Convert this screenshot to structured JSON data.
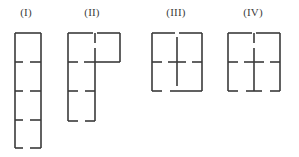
{
  "page": {
    "background_color": "#ffffff",
    "line_color": "#3a3a3a",
    "line_width": 1.6
  },
  "labels": [
    {
      "id": "I",
      "text": "(I)"
    },
    {
      "id": "II",
      "text": "(II)"
    },
    {
      "id": "III",
      "text": "(III)"
    },
    {
      "id": "IV",
      "text": "(IV)"
    }
  ],
  "chart_data": {
    "type": "diagram",
    "figures": [
      {
        "label": "(I)",
        "shape": "tall narrow rectangle with three interior horizontal divider pairs",
        "bounds": {
          "x1": 15,
          "y1": 33,
          "x2": 41,
          "y2": 148
        },
        "segments": [
          {
            "name": "top-edge-left",
            "x1": 15,
            "y1": 33,
            "x2": 28,
            "y2": 33
          },
          {
            "name": "top-edge-right",
            "x1": 28,
            "y1": 33,
            "x2": 41,
            "y2": 33
          },
          {
            "name": "left-edge-upper",
            "x1": 15,
            "y1": 33,
            "x2": 15,
            "y2": 62
          },
          {
            "name": "left-edge-second",
            "x1": 15,
            "y1": 62,
            "x2": 15,
            "y2": 91
          },
          {
            "name": "left-edge-third",
            "x1": 15,
            "y1": 91,
            "x2": 15,
            "y2": 120
          },
          {
            "name": "left-edge-lower",
            "x1": 15,
            "y1": 120,
            "x2": 15,
            "y2": 148
          },
          {
            "name": "right-edge-upper",
            "x1": 41,
            "y1": 33,
            "x2": 41,
            "y2": 62
          },
          {
            "name": "right-edge-second",
            "x1": 41,
            "y1": 62,
            "x2": 41,
            "y2": 91
          },
          {
            "name": "right-edge-third",
            "x1": 41,
            "y1": 91,
            "x2": 41,
            "y2": 120
          },
          {
            "name": "right-edge-lower",
            "x1": 41,
            "y1": 120,
            "x2": 41,
            "y2": 148
          },
          {
            "name": "divider1-left-stub",
            "x1": 15,
            "y1": 62,
            "x2": 23,
            "y2": 62
          },
          {
            "name": "divider1-right-stub",
            "x1": 30,
            "y1": 62,
            "x2": 41,
            "y2": 62
          },
          {
            "name": "divider2-left-stub",
            "x1": 15,
            "y1": 91,
            "x2": 23,
            "y2": 91
          },
          {
            "name": "divider2-right-stub",
            "x1": 30,
            "y1": 91,
            "x2": 41,
            "y2": 91
          },
          {
            "name": "divider3-left-stub",
            "x1": 15,
            "y1": 120,
            "x2": 23,
            "y2": 120
          },
          {
            "name": "divider3-right-stub",
            "x1": 30,
            "y1": 120,
            "x2": 41,
            "y2": 120
          },
          {
            "name": "bottom-edge-left",
            "x1": 15,
            "y1": 148,
            "x2": 23,
            "y2": 148
          },
          {
            "name": "bottom-edge-right",
            "x1": 30,
            "y1": 148,
            "x2": 41,
            "y2": 148
          }
        ]
      },
      {
        "label": "(II)",
        "shape": "P / L shaped outline: wide upper box over a narrow lower column",
        "bounds": {
          "x1": 68,
          "y1": 33,
          "x2": 120,
          "y2": 121
        },
        "segments": [
          {
            "name": "top-edge-left",
            "x1": 68,
            "y1": 33,
            "x2": 93,
            "y2": 33
          },
          {
            "name": "top-edge-right",
            "x1": 97,
            "y1": 33,
            "x2": 120,
            "y2": 33
          },
          {
            "name": "top-stub-vertical",
            "x1": 95,
            "y1": 33,
            "x2": 95,
            "y2": 43
          },
          {
            "name": "outer-left-upper",
            "x1": 68,
            "y1": 33,
            "x2": 68,
            "y2": 62
          },
          {
            "name": "outer-left-second",
            "x1": 68,
            "y1": 62,
            "x2": 68,
            "y2": 91
          },
          {
            "name": "outer-left-lower",
            "x1": 68,
            "y1": 91,
            "x2": 68,
            "y2": 121
          },
          {
            "name": "outer-right-upper",
            "x1": 120,
            "y1": 33,
            "x2": 120,
            "y2": 62
          },
          {
            "name": "mid-horizontal-right",
            "x1": 95,
            "y1": 62,
            "x2": 120,
            "y2": 62
          },
          {
            "name": "mid-left-stub",
            "x1": 68,
            "y1": 62,
            "x2": 78,
            "y2": 62
          },
          {
            "name": "mid-center-stub",
            "x1": 84,
            "y1": 62,
            "x2": 95,
            "y2": 62
          },
          {
            "name": "inner-vertical-upper",
            "x1": 95,
            "y1": 48,
            "x2": 95,
            "y2": 62
          },
          {
            "name": "inner-vertical-mid",
            "x1": 95,
            "y1": 62,
            "x2": 95,
            "y2": 91
          },
          {
            "name": "inner-vertical-lower",
            "x1": 95,
            "y1": 91,
            "x2": 95,
            "y2": 121
          },
          {
            "name": "divider-left-stub",
            "x1": 68,
            "y1": 91,
            "x2": 78,
            "y2": 91
          },
          {
            "name": "divider-right-stub",
            "x1": 85,
            "y1": 91,
            "x2": 95,
            "y2": 91
          },
          {
            "name": "bottom-edge-left",
            "x1": 68,
            "y1": 121,
            "x2": 78,
            "y2": 121
          },
          {
            "name": "bottom-edge-right",
            "x1": 85,
            "y1": 121,
            "x2": 95,
            "y2": 121
          }
        ]
      },
      {
        "label": "(III)",
        "shape": "square with a central vertical divider and horizontal stubs forming a cross",
        "bounds": {
          "x1": 152,
          "y1": 33,
          "x2": 202,
          "y2": 91
        },
        "segments": [
          {
            "name": "top-edge-left",
            "x1": 152,
            "y1": 33,
            "x2": 175,
            "y2": 33
          },
          {
            "name": "top-edge-right",
            "x1": 179,
            "y1": 33,
            "x2": 202,
            "y2": 33
          },
          {
            "name": "left-edge-upper",
            "x1": 152,
            "y1": 33,
            "x2": 152,
            "y2": 62
          },
          {
            "name": "left-edge-lower",
            "x1": 152,
            "y1": 62,
            "x2": 152,
            "y2": 91
          },
          {
            "name": "right-edge-upper",
            "x1": 202,
            "y1": 33,
            "x2": 202,
            "y2": 62
          },
          {
            "name": "right-edge-lower",
            "x1": 202,
            "y1": 62,
            "x2": 202,
            "y2": 91
          },
          {
            "name": "center-vertical-upper",
            "x1": 177,
            "y1": 37,
            "x2": 177,
            "y2": 62
          },
          {
            "name": "center-vertical-lower",
            "x1": 177,
            "y1": 62,
            "x2": 177,
            "y2": 86
          },
          {
            "name": "mid-left-stub",
            "x1": 152,
            "y1": 62,
            "x2": 162,
            "y2": 62
          },
          {
            "name": "mid-center-left-stub",
            "x1": 168,
            "y1": 62,
            "x2": 177,
            "y2": 62
          },
          {
            "name": "mid-center-right-stub",
            "x1": 177,
            "y1": 62,
            "x2": 186,
            "y2": 62
          },
          {
            "name": "mid-right-stub",
            "x1": 192,
            "y1": 62,
            "x2": 202,
            "y2": 62
          },
          {
            "name": "bottom-edge-left",
            "x1": 152,
            "y1": 91,
            "x2": 162,
            "y2": 91
          },
          {
            "name": "bottom-edge-center",
            "x1": 170,
            "y1": 91,
            "x2": 202,
            "y2": 91
          }
        ]
      },
      {
        "label": "(IV)",
        "shape": "square with an interior plus/cross and a footed central vertical",
        "bounds": {
          "x1": 228,
          "y1": 33,
          "x2": 280,
          "y2": 91
        },
        "segments": [
          {
            "name": "top-edge-left",
            "x1": 228,
            "y1": 33,
            "x2": 252,
            "y2": 33
          },
          {
            "name": "top-edge-right",
            "x1": 256,
            "y1": 33,
            "x2": 280,
            "y2": 33
          },
          {
            "name": "top-stub-vertical",
            "x1": 254,
            "y1": 33,
            "x2": 254,
            "y2": 43
          },
          {
            "name": "left-edge-upper",
            "x1": 228,
            "y1": 33,
            "x2": 228,
            "y2": 62
          },
          {
            "name": "left-edge-lower",
            "x1": 228,
            "y1": 62,
            "x2": 228,
            "y2": 91
          },
          {
            "name": "right-edge-upper",
            "x1": 280,
            "y1": 33,
            "x2": 280,
            "y2": 62
          },
          {
            "name": "right-edge-lower",
            "x1": 280,
            "y1": 62,
            "x2": 280,
            "y2": 91
          },
          {
            "name": "center-vertical-upper",
            "x1": 254,
            "y1": 48,
            "x2": 254,
            "y2": 62
          },
          {
            "name": "center-vertical-lower",
            "x1": 254,
            "y1": 62,
            "x2": 254,
            "y2": 91
          },
          {
            "name": "mid-left-stub",
            "x1": 228,
            "y1": 62,
            "x2": 238,
            "y2": 62
          },
          {
            "name": "mid-center-left-stub",
            "x1": 244,
            "y1": 62,
            "x2": 254,
            "y2": 62
          },
          {
            "name": "mid-center-right-stub",
            "x1": 254,
            "y1": 62,
            "x2": 264,
            "y2": 62
          },
          {
            "name": "mid-right-stub",
            "x1": 270,
            "y1": 62,
            "x2": 280,
            "y2": 62
          },
          {
            "name": "bottom-edge-left",
            "x1": 228,
            "y1": 91,
            "x2": 238,
            "y2": 91
          },
          {
            "name": "bottom-foot-left",
            "x1": 246,
            "y1": 91,
            "x2": 254,
            "y2": 91
          },
          {
            "name": "bottom-foot-right",
            "x1": 254,
            "y1": 91,
            "x2": 262,
            "y2": 91
          },
          {
            "name": "bottom-edge-right",
            "x1": 270,
            "y1": 91,
            "x2": 280,
            "y2": 91
          }
        ]
      }
    ]
  }
}
